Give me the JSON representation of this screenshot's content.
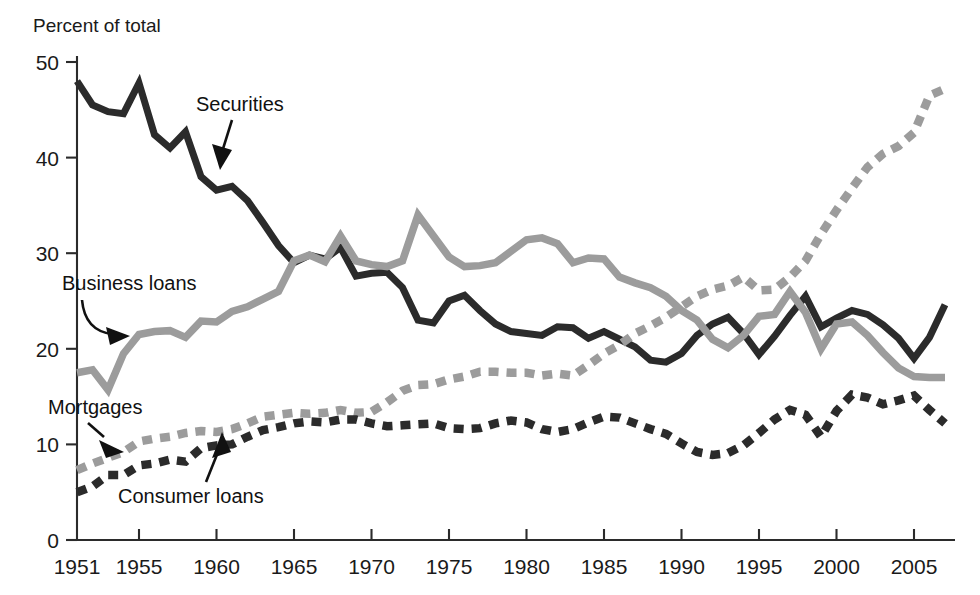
{
  "chart_data": {
    "type": "line",
    "title": "",
    "ylabel": "Percent of total",
    "xlabel": "",
    "ylim": [
      0,
      50
    ],
    "xlim": [
      1951,
      2007
    ],
    "yticks": [
      0,
      10,
      20,
      30,
      40,
      50
    ],
    "xticks": [
      1951,
      1955,
      1960,
      1965,
      1970,
      1975,
      1980,
      1985,
      1990,
      1995,
      2000,
      2005
    ],
    "grid": false,
    "legend_position": "inline-annotations",
    "x": [
      1951,
      1952,
      1953,
      1954,
      1955,
      1956,
      1957,
      1958,
      1959,
      1960,
      1961,
      1962,
      1963,
      1964,
      1965,
      1966,
      1967,
      1968,
      1969,
      1970,
      1971,
      1972,
      1973,
      1974,
      1975,
      1976,
      1977,
      1978,
      1979,
      1980,
      1981,
      1982,
      1983,
      1984,
      1985,
      1986,
      1987,
      1988,
      1989,
      1990,
      1991,
      1992,
      1993,
      1994,
      1995,
      1996,
      1997,
      1998,
      1999,
      2000,
      2001,
      2002,
      2003,
      2004,
      2005,
      2006,
      2007
    ],
    "series": [
      {
        "name": "Securities",
        "style": "solid",
        "color": "#2b2b2b",
        "values": [
          48.0,
          45.5,
          44.8,
          44.6,
          47.8,
          42.4,
          41.0,
          42.7,
          38.0,
          36.6,
          37.0,
          35.5,
          33.2,
          30.8,
          29.0,
          29.8,
          29.4,
          30.6,
          27.6,
          27.9,
          28.0,
          26.4,
          23.0,
          22.7,
          25.0,
          25.6,
          24.0,
          22.6,
          21.8,
          21.6,
          21.4,
          22.3,
          22.2,
          21.1,
          21.8,
          21.0,
          20.2,
          18.8,
          18.6,
          19.5,
          21.4,
          22.6,
          23.3,
          21.6,
          19.4,
          21.3,
          23.5,
          25.5,
          22.3,
          23.2,
          24.0,
          23.6,
          22.5,
          21.1,
          19.0,
          21.2,
          24.6
        ]
      },
      {
        "name": "Business loans",
        "style": "solid",
        "color": "#9c9c9c",
        "values": [
          17.5,
          17.8,
          15.7,
          19.5,
          21.5,
          21.8,
          21.9,
          21.2,
          22.9,
          22.8,
          23.9,
          24.4,
          25.2,
          26.0,
          29.2,
          29.8,
          29.1,
          31.8,
          29.2,
          28.8,
          28.6,
          29.2,
          34.0,
          31.8,
          29.6,
          28.6,
          28.7,
          29.0,
          30.2,
          31.4,
          31.6,
          31.0,
          29.0,
          29.5,
          29.4,
          27.5,
          26.9,
          26.4,
          25.5,
          24.0,
          23.0,
          21.0,
          20.1,
          21.4,
          23.4,
          23.6,
          26.0,
          23.8,
          20.0,
          22.6,
          22.8,
          21.4,
          19.6,
          18.0,
          17.1,
          17.0,
          17.0
        ]
      },
      {
        "name": "Mortgages",
        "style": "dashed",
        "color": "#9c9c9c",
        "values": [
          7.3,
          8.0,
          8.6,
          9.2,
          10.3,
          10.6,
          10.8,
          11.2,
          11.4,
          11.3,
          11.6,
          12.2,
          12.9,
          13.1,
          13.3,
          13.2,
          13.3,
          13.6,
          13.3,
          13.4,
          14.4,
          15.6,
          16.2,
          16.3,
          16.8,
          17.1,
          17.6,
          17.6,
          17.5,
          17.5,
          17.2,
          17.4,
          17.2,
          18.3,
          19.5,
          20.4,
          21.6,
          22.4,
          23.3,
          24.4,
          25.5,
          26.2,
          26.6,
          27.5,
          26.1,
          26.2,
          27.5,
          29.2,
          32.0,
          34.5,
          36.8,
          39.0,
          40.4,
          41.2,
          42.6,
          46.5,
          47.2
        ]
      },
      {
        "name": "Consumer loans",
        "style": "dashed",
        "color": "#2b2b2b",
        "values": [
          5.0,
          5.6,
          6.8,
          6.8,
          7.8,
          8.0,
          8.4,
          8.2,
          9.6,
          9.9,
          10.0,
          10.8,
          11.5,
          11.8,
          12.2,
          12.4,
          12.3,
          12.6,
          12.6,
          12.2,
          11.9,
          12.0,
          12.1,
          12.2,
          11.7,
          11.6,
          11.7,
          12.2,
          12.5,
          12.3,
          11.6,
          11.3,
          11.6,
          12.3,
          12.9,
          12.8,
          12.2,
          11.6,
          11.1,
          10.1,
          9.2,
          8.9,
          9.1,
          9.9,
          11.2,
          12.6,
          13.6,
          13.1,
          10.8,
          13.5,
          15.2,
          14.9,
          14.2,
          14.6,
          15.1,
          13.6,
          12.2
        ]
      }
    ]
  },
  "axes": {
    "y_title": "Percent of total",
    "y_tick_labels": [
      "50",
      "40",
      "30",
      "20",
      "10",
      "0"
    ],
    "x_tick_labels": [
      "1951",
      "1955",
      "1960",
      "1965",
      "1970",
      "1975",
      "1980",
      "1985",
      "1990",
      "1995",
      "2000",
      "2005"
    ]
  },
  "annotations": [
    {
      "id": "securities",
      "label": "Securities"
    },
    {
      "id": "business-loans",
      "label": "Business loans"
    },
    {
      "id": "mortgages",
      "label": "Mortgages"
    },
    {
      "id": "consumer-loans",
      "label": "Consumer loans"
    }
  ],
  "colors": {
    "dark": "#2b2b2b",
    "gray": "#9c9c9c",
    "text": "#1a1a1a",
    "background": "#ffffff"
  }
}
